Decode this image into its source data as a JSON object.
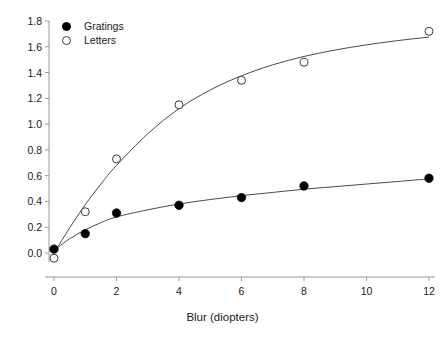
{
  "chart_data": {
    "type": "scatter",
    "title": "",
    "xlabel": "Blur (diopters)",
    "ylabel": "",
    "xlim": [
      0,
      12
    ],
    "ylim": [
      0.0,
      1.8
    ],
    "grid": false,
    "legend_position": "top-left",
    "xticks": [
      "0",
      "2",
      "4",
      "6",
      "8",
      "10",
      "12"
    ],
    "xtick_values": [
      0,
      2,
      4,
      6,
      8,
      10,
      12
    ],
    "yticks": [
      "0.0",
      "0.2",
      "0.4",
      "0.6",
      "0.8",
      "1.0",
      "1.2",
      "1.4",
      "1.6",
      "1.8"
    ],
    "ytick_values": [
      0.0,
      0.2,
      0.4,
      0.6,
      0.8,
      1.0,
      1.2,
      1.4,
      1.6,
      1.8
    ],
    "series": [
      {
        "name": "Gratings",
        "marker": "filled-circle",
        "color": "#000000",
        "x": [
          0,
          1,
          2,
          4,
          6,
          8,
          12
        ],
        "values": [
          0.03,
          0.15,
          0.31,
          0.37,
          0.43,
          0.52,
          0.58
        ],
        "fit_curve": {
          "x": [
            0,
            0.5,
            1,
            1.5,
            2,
            3,
            4,
            5,
            6,
            7,
            8,
            9,
            10,
            11,
            12
          ],
          "y": [
            0.02,
            0.11,
            0.18,
            0.235,
            0.28,
            0.335,
            0.38,
            0.415,
            0.445,
            0.47,
            0.495,
            0.515,
            0.535,
            0.555,
            0.575
          ]
        }
      },
      {
        "name": "Letters",
        "marker": "open-circle",
        "color": "#000000",
        "x": [
          0,
          1,
          2,
          4,
          6,
          8,
          12
        ],
        "values": [
          -0.04,
          0.32,
          0.73,
          1.15,
          1.34,
          1.48,
          1.72
        ],
        "fit_curve": {
          "x": [
            0,
            0.5,
            1,
            1.5,
            2,
            3,
            4,
            5,
            6,
            7,
            8,
            9,
            10,
            11,
            12
          ],
          "y": [
            0.0,
            0.195,
            0.375,
            0.535,
            0.68,
            0.925,
            1.12,
            1.265,
            1.375,
            1.46,
            1.525,
            1.575,
            1.615,
            1.648,
            1.675
          ]
        }
      }
    ]
  },
  "legend": {
    "entries": [
      {
        "label": "Gratings",
        "marker": "filled-circle"
      },
      {
        "label": "Letters",
        "marker": "open-circle"
      }
    ]
  },
  "axes": {
    "x_title": "Blur (diopters)"
  },
  "colors": {
    "axis": "#9a9a9a",
    "marker": "#000000",
    "curve": "#4a4a4a",
    "text": "#1a1a1a",
    "background": "#ffffff"
  }
}
